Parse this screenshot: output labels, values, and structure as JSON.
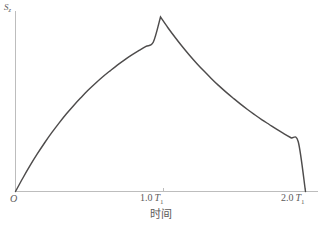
{
  "figure": {
    "background_color": "#ffffff",
    "curve_color": "#4e4c4c",
    "axis_color": "#bdbdbd",
    "text_color": "#5c5a5a"
  },
  "axes": {
    "origin_label": "O",
    "y_axis": {
      "symbol": "S",
      "subscript": "z",
      "label": "Sz"
    },
    "x_axis": {
      "title": "时间",
      "ticks": [
        {
          "value": "1.0",
          "symbol": "T",
          "subscript": "1",
          "label": "1.0 T1"
        },
        {
          "value": "2.0",
          "symbol": "T",
          "subscript": "1",
          "label": "2.0 T1"
        }
      ]
    }
  },
  "chart_data": {
    "type": "line",
    "title": "",
    "xlabel": "时间",
    "ylabel": "Sz",
    "xlim": [
      0,
      2.0
    ],
    "ylim": [
      0,
      1.0
    ],
    "xtick_labels": [
      "O",
      "1.0 T1",
      "2.0 T1"
    ],
    "xtick_values": [
      0,
      1.0,
      2.0
    ],
    "ytick_labels": [],
    "grid": false,
    "legend": null,
    "annotations": [],
    "series": [
      {
        "name": "Sz",
        "x": [
          0.0,
          0.05,
          0.1,
          0.15,
          0.2,
          0.25,
          0.3,
          0.35,
          0.4,
          0.45,
          0.5,
          0.55,
          0.6,
          0.65,
          0.7,
          0.75,
          0.8,
          0.85,
          0.9,
          0.95,
          1.0,
          1.05,
          1.1,
          1.15,
          1.2,
          1.25,
          1.3,
          1.35,
          1.4,
          1.45,
          1.5,
          1.55,
          1.6,
          1.65,
          1.7,
          1.75,
          1.8,
          1.85,
          1.9,
          1.95,
          2.0
        ],
        "y": [
          0.0,
          0.076,
          0.148,
          0.215,
          0.278,
          0.337,
          0.392,
          0.444,
          0.492,
          0.537,
          0.58,
          0.619,
          0.656,
          0.69,
          0.723,
          0.753,
          0.781,
          0.807,
          0.832,
          0.855,
          1.0,
          0.94,
          0.884,
          0.831,
          0.781,
          0.734,
          0.69,
          0.648,
          0.608,
          0.571,
          0.536,
          0.502,
          0.47,
          0.44,
          0.411,
          0.384,
          0.357,
          0.332,
          0.308,
          0.285,
          0.0
        ]
      }
    ],
    "peak": {
      "x": 1.0,
      "y": 1.0,
      "label": ""
    }
  }
}
